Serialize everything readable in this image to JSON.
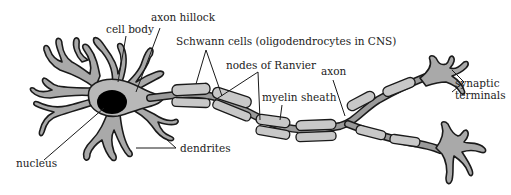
{
  "figure": {
    "labels": {
      "cell_body": "cell body",
      "axon_hillock": "axon hillock",
      "schwann_cells": "Schwann cells (oligodendrocytes in CNS)",
      "nodes_of_ranvier": "nodes of Ranvier",
      "axon": "axon",
      "myelin_sheath": "myelin sheath",
      "synaptic_terminals_line1": "synaptic",
      "synaptic_terminals_line2": "terminals",
      "dendrites": "dendrites",
      "nucleus": "nucleus"
    },
    "colors": {
      "cell_fill": "#a9a9a9",
      "soma_fill": "#b8b8b8",
      "myelin_fill": "#c8c8c8",
      "nucleus_fill": "#000000",
      "outline": "#1a1a1a",
      "background": "#ffffff"
    }
  }
}
